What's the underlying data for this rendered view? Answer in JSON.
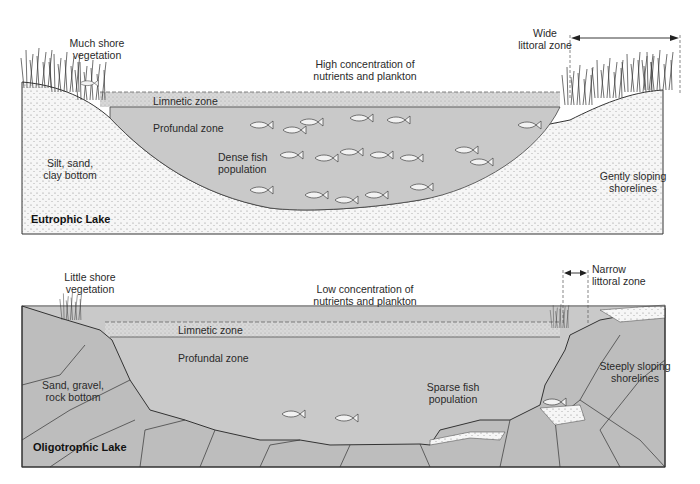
{
  "diagram": {
    "panels": [
      {
        "title": "Eutrophic Lake",
        "labels": {
          "shore_vegetation": "Much shore\nvegetation",
          "nutrients": "High concentration of\nnutrients and plankton",
          "littoral": "Wide\nlittoral zone",
          "limnetic": "Limnetic zone",
          "profundal": "Profundal zone",
          "fish": "Dense fish\npopulation",
          "bottom": "Silt, sand,\nclay bottom",
          "shoreline": "Gently sloping\nshorelines"
        }
      },
      {
        "title": "Oligotrophic Lake",
        "labels": {
          "shore_vegetation": "Little shore\nvegetation",
          "nutrients": "Low concentration of\nnutrients and plankton",
          "littoral": "Narrow\nlittoral zone",
          "limnetic": "Limnetic zone",
          "profundal": "Profundal zone",
          "fish": "Sparse fish\npopulation",
          "bottom": "Sand, gravel,\nrock bottom",
          "shoreline": "Steeply sloping\nshorelines"
        }
      }
    ],
    "colors": {
      "water": "#c9c9c9",
      "limnetic": "#d9d9d9",
      "rock": "#bdbdbd",
      "sediment": "#f4f4f4",
      "outline": "#333333"
    }
  }
}
